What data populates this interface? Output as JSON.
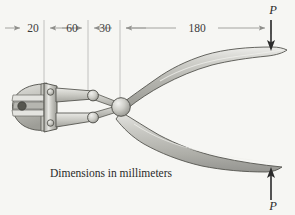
{
  "figure": {
    "name": "pliers-free-body-diagram",
    "background_color": "#f6f6f3",
    "caption": "Dimensions in millimeters"
  },
  "dimensions": {
    "unit": "mm",
    "line_y": 28,
    "segments": [
      {
        "label": "20",
        "value": 20,
        "x_start": 5,
        "x_end": 44
      },
      {
        "label": "60",
        "value": 60,
        "x_start": 44,
        "x_end": 88
      },
      {
        "label": "30",
        "value": 30,
        "x_start": 88,
        "x_end": 120
      },
      {
        "label": "180",
        "value": 180,
        "x_start": 120,
        "x_end": 271
      }
    ],
    "extension_lines_x": [
      44,
      88,
      120,
      271
    ]
  },
  "loads": [
    {
      "label": "P",
      "name": "load-top",
      "direction": "down",
      "x": 271,
      "label_x": 273,
      "label_y": 14,
      "arrow_y_start": 20,
      "arrow_y_end": 50
    },
    {
      "label": "P",
      "name": "load-bottom",
      "direction": "up",
      "x": 271,
      "label_x": 273,
      "label_y": 209,
      "arrow_y_start": 200,
      "arrow_y_end": 168
    }
  ],
  "colors": {
    "metal_light": "#dcdcd8",
    "metal_mid": "#b9b9b3",
    "metal_dark": "#8f8f89",
    "outline": "#4a4a46",
    "dim_line": "#9a9a96",
    "text": "#2b2b2b",
    "pin_dark": "#56564f"
  },
  "parts": [
    {
      "name": "jaw-head",
      "label": "jaw head"
    },
    {
      "name": "jaw-plate",
      "label": "riveted plate"
    },
    {
      "name": "cutting-blade-upper",
      "label": "upper blade"
    },
    {
      "name": "cutting-blade-lower",
      "label": "lower blade"
    },
    {
      "name": "pivot-ball",
      "label": "central pivot"
    },
    {
      "name": "link-pin-upper",
      "label": "upper link pin"
    },
    {
      "name": "link-pin-lower",
      "label": "lower link pin"
    },
    {
      "name": "handle-upper",
      "label": "upper handle"
    },
    {
      "name": "handle-lower",
      "label": "lower handle"
    },
    {
      "name": "rivet-upper",
      "label": "upper rivet"
    },
    {
      "name": "rivet-lower",
      "label": "lower rivet"
    },
    {
      "name": "jaw-bolt",
      "label": "jaw bolt"
    }
  ]
}
